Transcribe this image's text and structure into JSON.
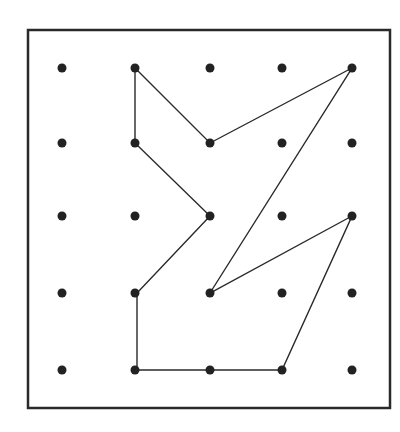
{
  "diagram": {
    "type": "geoboard",
    "grid": {
      "rows": 5,
      "cols": 5,
      "col_x": [
        62,
        135,
        210,
        282,
        352
      ],
      "row_y": [
        68,
        143,
        216,
        293,
        370
      ],
      "dot_radius": 4.5,
      "dot_color": "#222222"
    },
    "border": {
      "x": 28,
      "y": 30,
      "width": 362,
      "height": 378,
      "stroke": "#2a2a2a",
      "stroke_width": 2.5
    },
    "polygon": {
      "stroke": "#2a2a2a",
      "stroke_width": 1.4,
      "vertices_grid": [
        [
          0,
          1
        ],
        [
          1,
          2
        ],
        [
          0,
          4
        ],
        [
          3,
          2
        ],
        [
          2,
          4
        ],
        [
          4,
          3
        ],
        [
          4,
          1
        ],
        [
          3,
          1
        ],
        [
          2,
          2
        ],
        [
          1,
          1
        ]
      ],
      "vertices_px": [
        [
          135,
          68
        ],
        [
          210,
          143
        ],
        [
          352,
          68
        ],
        [
          210,
          293
        ],
        [
          352,
          216
        ],
        [
          282,
          370
        ],
        [
          137,
          370
        ],
        [
          137,
          293
        ],
        [
          210,
          216
        ],
        [
          135,
          143
        ]
      ]
    }
  }
}
